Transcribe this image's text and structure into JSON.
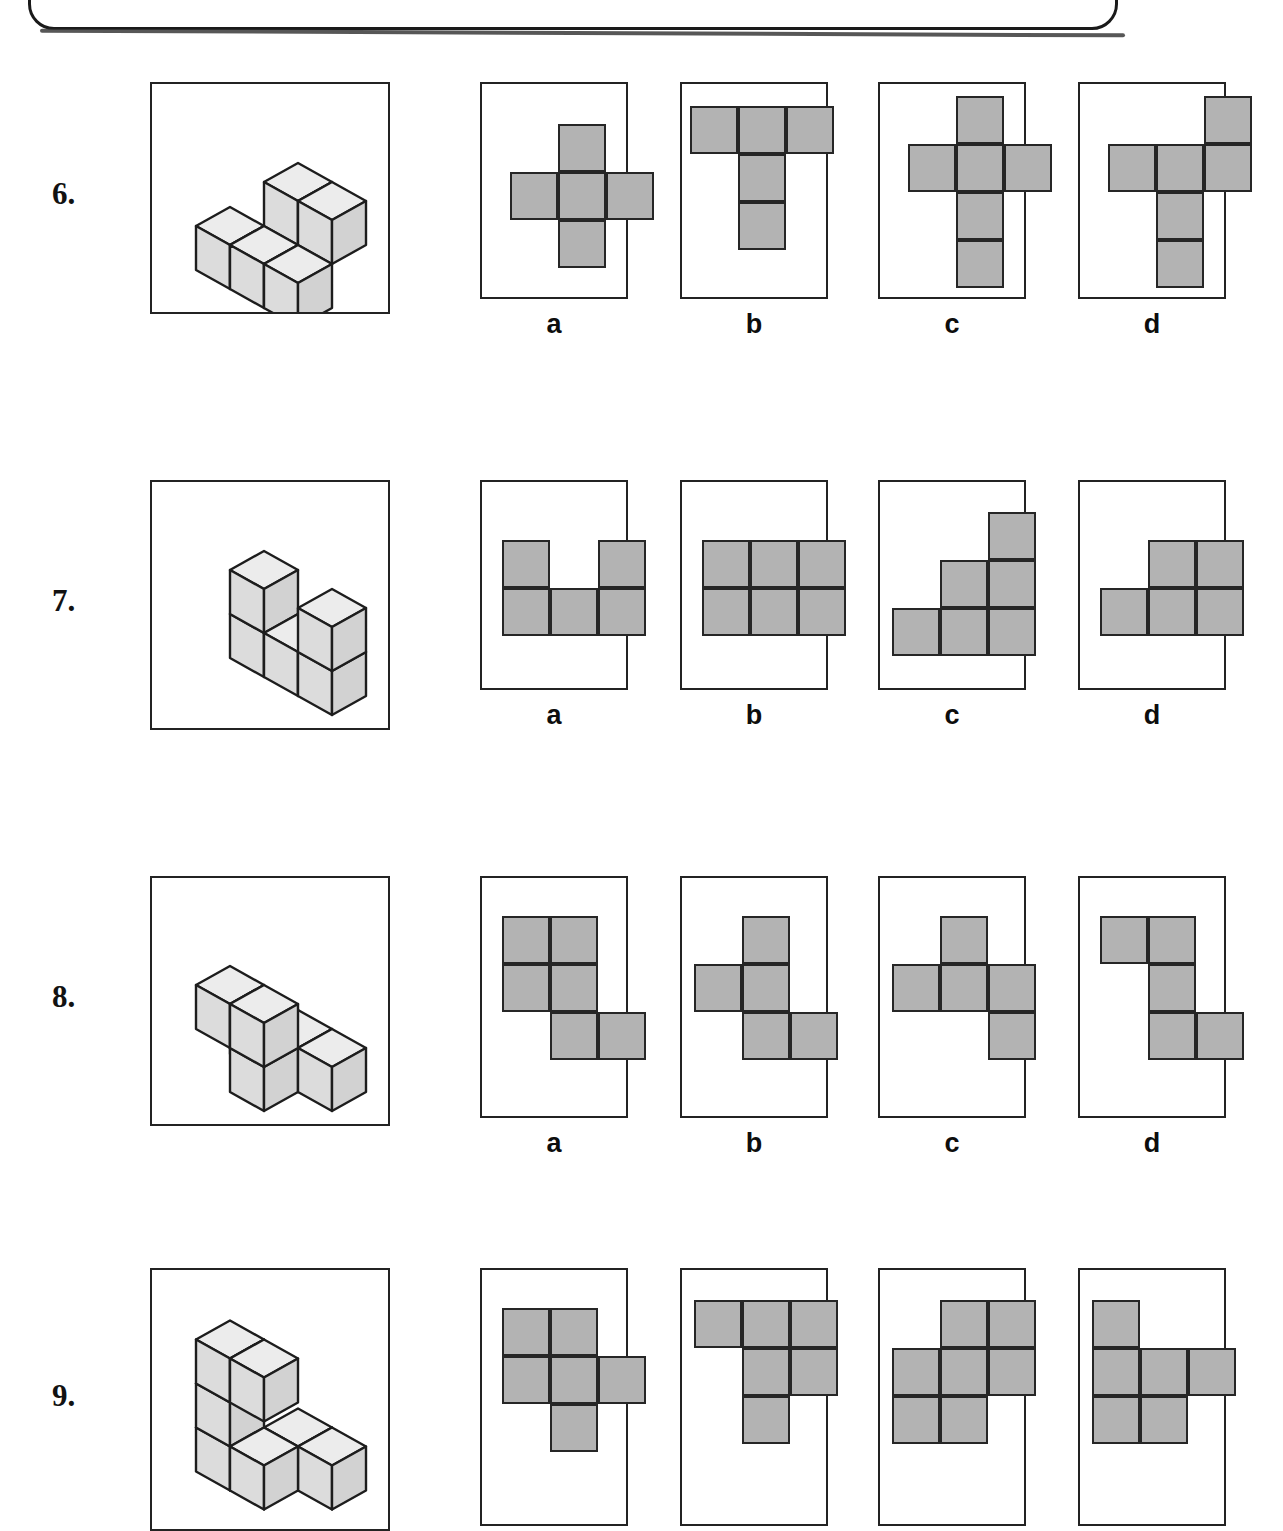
{
  "page": {
    "banner_present": true,
    "cell_size_px": 48,
    "fill_color": "#b3b3b3",
    "stroke_color": "#262626",
    "box_border_color": "#232323",
    "background": "#ffffff"
  },
  "option_letters": [
    "a",
    "b",
    "c",
    "d"
  ],
  "questions": [
    {
      "number": "6.",
      "figure": {
        "name": "isometric-cube-stack-6",
        "description": "Five unit cubes: an upper pair of cubes on the right sitting on top of a lower stepped row, with two cubes stepping down to the lower-left.",
        "cube_count": 5,
        "cubes": [
          {
            "x": 1,
            "y": 0,
            "z": 1
          },
          {
            "x": 2,
            "y": 0,
            "z": 1
          },
          {
            "x": 0,
            "y": 1,
            "z": 0
          },
          {
            "x": 1,
            "y": 1,
            "z": 0
          },
          {
            "x": 2,
            "y": 1,
            "z": 0
          }
        ]
      },
      "options": [
        {
          "letter": "a",
          "cols": 3,
          "rows": 3,
          "filled": [
            [
              0,
              1
            ],
            [
              1,
              0
            ],
            [
              1,
              1
            ],
            [
              1,
              2
            ],
            [
              2,
              1
            ]
          ]
        },
        {
          "letter": "b",
          "cols": 3,
          "rows": 3,
          "filled": [
            [
              0,
              0
            ],
            [
              0,
              1
            ],
            [
              0,
              2
            ],
            [
              1,
              1
            ],
            [
              2,
              1
            ]
          ]
        },
        {
          "letter": "c",
          "cols": 3,
          "rows": 4,
          "filled": [
            [
              0,
              1
            ],
            [
              1,
              0
            ],
            [
              1,
              1
            ],
            [
              1,
              2
            ],
            [
              2,
              1
            ],
            [
              3,
              1
            ]
          ]
        },
        {
          "letter": "d",
          "cols": 3,
          "rows": 4,
          "filled": [
            [
              0,
              2
            ],
            [
              1,
              0
            ],
            [
              1,
              1
            ],
            [
              1,
              2
            ],
            [
              2,
              1
            ],
            [
              3,
              1
            ]
          ]
        }
      ]
    },
    {
      "number": "7.",
      "figure": {
        "name": "isometric-cube-stack-7",
        "description": "U-shaped arrangement: a flat base row of three cubes with one cube raised at each end, leaving the middle open.",
        "cube_count": 5,
        "cubes": [
          {
            "x": 0,
            "y": 0,
            "z": 0
          },
          {
            "x": 1,
            "y": 0,
            "z": 0
          },
          {
            "x": 2,
            "y": 0,
            "z": 0
          },
          {
            "x": 0,
            "y": 0,
            "z": 1
          },
          {
            "x": 2,
            "y": 0,
            "z": 1
          }
        ]
      },
      "options": [
        {
          "letter": "a",
          "cols": 3,
          "rows": 2,
          "filled": [
            [
              0,
              0
            ],
            [
              0,
              2
            ],
            [
              1,
              0
            ],
            [
              1,
              1
            ],
            [
              1,
              2
            ]
          ]
        },
        {
          "letter": "b",
          "cols": 3,
          "rows": 2,
          "filled": [
            [
              0,
              0
            ],
            [
              0,
              1
            ],
            [
              0,
              2
            ],
            [
              1,
              0
            ],
            [
              1,
              1
            ],
            [
              1,
              2
            ]
          ]
        },
        {
          "letter": "c",
          "cols": 3,
          "rows": 3,
          "filled": [
            [
              0,
              2
            ],
            [
              1,
              1
            ],
            [
              1,
              2
            ],
            [
              2,
              0
            ],
            [
              2,
              1
            ],
            [
              2,
              2
            ]
          ]
        },
        {
          "letter": "d",
          "cols": 3,
          "rows": 2,
          "filled": [
            [
              0,
              1
            ],
            [
              0,
              2
            ],
            [
              1,
              0
            ],
            [
              1,
              1
            ],
            [
              1,
              2
            ]
          ]
        }
      ]
    },
    {
      "number": "8.",
      "figure": {
        "name": "isometric-cube-stack-8",
        "description": "Two cubes form an upper block on the left, a single column drops down to a lower group of three cubes arranged in an L on the base level.",
        "cube_count": 6,
        "cubes": [
          {
            "x": 0,
            "y": 1,
            "z": 1
          },
          {
            "x": 1,
            "y": 1,
            "z": 1
          },
          {
            "x": 1,
            "y": 1,
            "z": 0
          },
          {
            "x": 0,
            "y": 0,
            "z": 0
          },
          {
            "x": 1,
            "y": 0,
            "z": 0
          },
          {
            "x": 2,
            "y": 0,
            "z": 0
          }
        ]
      },
      "options": [
        {
          "letter": "a",
          "cols": 3,
          "rows": 3,
          "filled": [
            [
              0,
              0
            ],
            [
              0,
              1
            ],
            [
              1,
              0
            ],
            [
              1,
              1
            ],
            [
              2,
              1
            ],
            [
              2,
              2
            ]
          ]
        },
        {
          "letter": "b",
          "cols": 3,
          "rows": 3,
          "filled": [
            [
              0,
              1
            ],
            [
              1,
              0
            ],
            [
              1,
              1
            ],
            [
              2,
              1
            ],
            [
              2,
              2
            ]
          ]
        },
        {
          "letter": "c",
          "cols": 3,
          "rows": 3,
          "filled": [
            [
              0,
              1
            ],
            [
              1,
              0
            ],
            [
              1,
              1
            ],
            [
              1,
              2
            ],
            [
              2,
              2
            ]
          ]
        },
        {
          "letter": "d",
          "cols": 3,
          "rows": 3,
          "filled": [
            [
              0,
              0
            ],
            [
              0,
              1
            ],
            [
              1,
              1
            ],
            [
              2,
              1
            ],
            [
              2,
              2
            ]
          ]
        }
      ]
    },
    {
      "number": "9.",
      "figure": {
        "name": "isometric-cube-stack-9",
        "description": "C-shaped stack: two cubes on top, a column on the left side, and two cubes stepping out at the bottom right.",
        "cube_count": 7,
        "cubes": [
          {
            "x": 0,
            "y": 1,
            "z": 2
          },
          {
            "x": 1,
            "y": 1,
            "z": 2
          },
          {
            "x": 0,
            "y": 1,
            "z": 1
          },
          {
            "x": 0,
            "y": 1,
            "z": 0
          },
          {
            "x": 1,
            "y": 0,
            "z": 0
          },
          {
            "x": 2,
            "y": 0,
            "z": 0
          },
          {
            "x": 1,
            "y": 1,
            "z": 0
          }
        ]
      },
      "options": [
        {
          "letter": "a",
          "cols": 3,
          "rows": 3,
          "filled": [
            [
              0,
              0
            ],
            [
              0,
              1
            ],
            [
              1,
              0
            ],
            [
              1,
              1
            ],
            [
              1,
              2
            ],
            [
              2,
              1
            ]
          ]
        },
        {
          "letter": "b",
          "cols": 3,
          "rows": 3,
          "filled": [
            [
              0,
              0
            ],
            [
              0,
              1
            ],
            [
              0,
              2
            ],
            [
              1,
              1
            ],
            [
              1,
              2
            ],
            [
              2,
              1
            ]
          ]
        },
        {
          "letter": "c",
          "cols": 3,
          "rows": 3,
          "filled": [
            [
              0,
              1
            ],
            [
              0,
              2
            ],
            [
              1,
              0
            ],
            [
              1,
              1
            ],
            [
              1,
              2
            ],
            [
              2,
              0
            ],
            [
              2,
              1
            ]
          ]
        },
        {
          "letter": "d",
          "cols": 3,
          "rows": 3,
          "filled": [
            [
              0,
              0
            ],
            [
              1,
              0
            ],
            [
              1,
              1
            ],
            [
              1,
              2
            ],
            [
              2,
              0
            ],
            [
              2,
              1
            ]
          ]
        }
      ]
    }
  ],
  "ghost_text": {
    "line1": "",
    "line2": ""
  }
}
